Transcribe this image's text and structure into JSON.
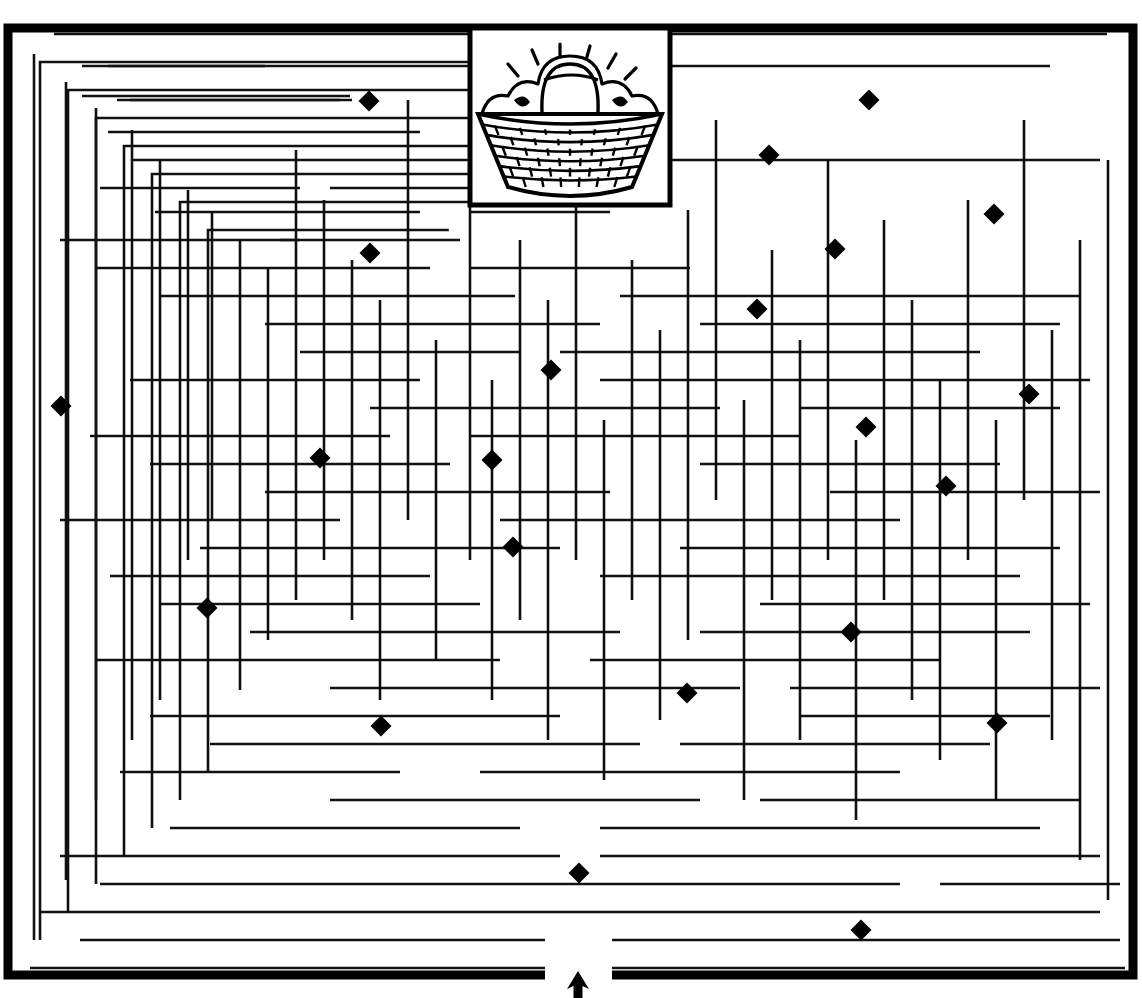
{
  "page": {
    "title": "Maze Puzzle",
    "kind": "printable-maze-worksheet",
    "width": 1142,
    "height": 998,
    "background_color": "#ffffff",
    "ink_color": "#000000"
  },
  "maze": {
    "name": "rectangular-grid-maze",
    "border": {
      "x": 8,
      "y": 28,
      "width": 1125,
      "height": 947,
      "stroke_width": 9,
      "color": "#000000"
    },
    "wall_stroke_width": 2.6,
    "wall_color": "#111111",
    "entrance": {
      "label": "entrance",
      "icon": "up-arrow-icon",
      "x": 578,
      "y": 975,
      "gap_left": 545,
      "gap_right": 612,
      "direction": "up"
    },
    "goal": {
      "label": "basket-of-laundry",
      "x": 470,
      "y": 28,
      "width": 200,
      "height": 177
    }
  },
  "picture_inset": {
    "name": "basket-illustration",
    "caption": "basket of laundry",
    "frame": {
      "x": 470,
      "y": 28,
      "width": 200,
      "height": 177,
      "stroke_width": 5
    },
    "elements": [
      "wicker-basket",
      "folded-laundry",
      "sparkle-lines"
    ]
  },
  "markers": {
    "label": "diamond-markers",
    "shape": "diamond",
    "color": "#000000",
    "count": 24,
    "size": 21,
    "points": [
      {
        "x": 369,
        "y": 101
      },
      {
        "x": 869,
        "y": 100
      },
      {
        "x": 769,
        "y": 155
      },
      {
        "x": 994,
        "y": 214
      },
      {
        "x": 835,
        "y": 249
      },
      {
        "x": 370,
        "y": 253
      },
      {
        "x": 757,
        "y": 309
      },
      {
        "x": 551,
        "y": 370
      },
      {
        "x": 1029,
        "y": 394
      },
      {
        "x": 61,
        "y": 406
      },
      {
        "x": 866,
        "y": 427
      },
      {
        "x": 320,
        "y": 458
      },
      {
        "x": 492,
        "y": 460
      },
      {
        "x": 946,
        "y": 486
      },
      {
        "x": 513,
        "y": 547
      },
      {
        "x": 207,
        "y": 608
      },
      {
        "x": 851,
        "y": 632
      },
      {
        "x": 687,
        "y": 693
      },
      {
        "x": 997,
        "y": 723
      },
      {
        "x": 381,
        "y": 726
      },
      {
        "x": 579,
        "y": 873
      },
      {
        "x": 861,
        "y": 930
      }
    ]
  },
  "walls": {
    "horizontal": [
      [
        34,
        54,
        1107
      ],
      [
        66,
        82,
        265
      ],
      [
        96,
        82,
        350
      ],
      [
        100,
        117,
        340
      ],
      [
        100,
        130,
        352
      ],
      [
        66,
        108,
        1050
      ],
      [
        132,
        108,
        420
      ],
      [
        160,
        133,
        560
      ],
      [
        160,
        600,
        1100
      ],
      [
        188,
        100,
        300
      ],
      [
        188,
        330,
        500
      ],
      [
        212,
        155,
        420
      ],
      [
        212,
        470,
        610
      ],
      [
        240,
        60,
        300
      ],
      [
        240,
        280,
        460
      ],
      [
        268,
        95,
        430
      ],
      [
        268,
        470,
        690
      ],
      [
        296,
        160,
        515
      ],
      [
        296,
        620,
        1080
      ],
      [
        324,
        265,
        600
      ],
      [
        324,
        700,
        1060
      ],
      [
        352,
        300,
        520
      ],
      [
        352,
        560,
        980
      ],
      [
        380,
        130,
        420
      ],
      [
        380,
        600,
        1090
      ],
      [
        408,
        370,
        720
      ],
      [
        408,
        800,
        1060
      ],
      [
        436,
        90,
        390
      ],
      [
        436,
        470,
        800
      ],
      [
        464,
        150,
        450
      ],
      [
        464,
        700,
        1000
      ],
      [
        492,
        265,
        610
      ],
      [
        492,
        830,
        1100
      ],
      [
        520,
        60,
        340
      ],
      [
        520,
        500,
        900
      ],
      [
        548,
        200,
        560
      ],
      [
        548,
        680,
        1060
      ],
      [
        576,
        110,
        430
      ],
      [
        576,
        600,
        1020
      ],
      [
        604,
        160,
        480
      ],
      [
        604,
        760,
        1090
      ],
      [
        632,
        250,
        620
      ],
      [
        632,
        700,
        1030
      ],
      [
        660,
        95,
        500
      ],
      [
        660,
        590,
        940
      ],
      [
        688,
        330,
        740
      ],
      [
        688,
        790,
        1100
      ],
      [
        716,
        150,
        560
      ],
      [
        716,
        800,
        1050
      ],
      [
        744,
        210,
        640
      ],
      [
        744,
        680,
        990
      ],
      [
        772,
        120,
        400
      ],
      [
        772,
        480,
        900
      ],
      [
        800,
        330,
        700
      ],
      [
        800,
        760,
        1080
      ],
      [
        828,
        170,
        520
      ],
      [
        828,
        600,
        1040
      ],
      [
        856,
        60,
        560
      ],
      [
        856,
        600,
        1100
      ],
      [
        884,
        100,
        900
      ],
      [
        884,
        940,
        1120
      ],
      [
        912,
        40,
        1100
      ],
      [
        940,
        80,
        545
      ],
      [
        940,
        612,
        1120
      ],
      [
        968,
        30,
        545
      ],
      [
        968,
        612,
        1125
      ]
    ],
    "vertical": [
      [
        34,
        54,
        940
      ],
      [
        66,
        82,
        880
      ],
      [
        96,
        108,
        800
      ],
      [
        132,
        130,
        740
      ],
      [
        160,
        160,
        700
      ],
      [
        188,
        190,
        560
      ],
      [
        212,
        212,
        520
      ],
      [
        240,
        240,
        690
      ],
      [
        268,
        268,
        640
      ],
      [
        296,
        150,
        600
      ],
      [
        324,
        200,
        560
      ],
      [
        352,
        260,
        620
      ],
      [
        380,
        300,
        700
      ],
      [
        408,
        100,
        520
      ],
      [
        436,
        340,
        660
      ],
      [
        470,
        205,
        560
      ],
      [
        492,
        380,
        700
      ],
      [
        520,
        240,
        620
      ],
      [
        548,
        300,
        740
      ],
      [
        576,
        180,
        560
      ],
      [
        604,
        420,
        780
      ],
      [
        632,
        260,
        600
      ],
      [
        660,
        330,
        720
      ],
      [
        688,
        210,
        640
      ],
      [
        716,
        120,
        500
      ],
      [
        744,
        400,
        800
      ],
      [
        772,
        250,
        600
      ],
      [
        800,
        340,
        740
      ],
      [
        828,
        160,
        560
      ],
      [
        856,
        440,
        820
      ],
      [
        884,
        220,
        600
      ],
      [
        912,
        300,
        700
      ],
      [
        940,
        380,
        760
      ],
      [
        968,
        200,
        560
      ],
      [
        996,
        420,
        800
      ],
      [
        1024,
        120,
        500
      ],
      [
        1052,
        330,
        740
      ],
      [
        1080,
        240,
        860
      ],
      [
        1108,
        160,
        900
      ]
    ]
  }
}
